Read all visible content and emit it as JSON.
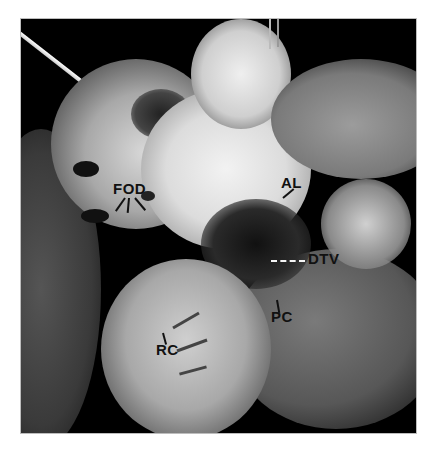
{
  "figure": {
    "type": "grayscale anatomical photograph of dissected heart",
    "background_color": "#000000",
    "labels": [
      {
        "id": "fod",
        "text": "FOD"
      },
      {
        "id": "al",
        "text": "AL"
      },
      {
        "id": "dtv",
        "text": "DTV"
      },
      {
        "id": "pc",
        "text": "PC"
      },
      {
        "id": "rc",
        "text": "RC"
      }
    ]
  },
  "caption": {
    "text": "",
    "note_visible": "caption clipped at bottom edge — unreadable"
  }
}
